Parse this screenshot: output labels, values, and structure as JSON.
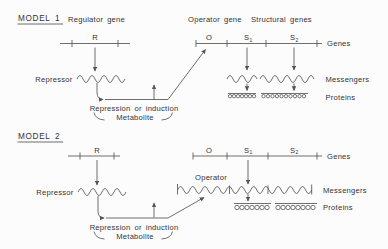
{
  "colors": {
    "ink": "#333333",
    "line": "#555555",
    "background": "#fcfcfc"
  },
  "model1": {
    "title": "MODEL 1",
    "regulator_gene": "Regulator gene",
    "operator_gene": "Operator gene",
    "structural_genes": "Structural genes",
    "r": "R",
    "o": "O",
    "s1": {
      "base": "S",
      "sub": "1"
    },
    "s2": {
      "base": "S",
      "sub": "2"
    },
    "genes": "Genes",
    "messengers": "Messengers",
    "proteins": "Proteins",
    "repressor": "Repressor",
    "repression": "Repression or induction",
    "metabolite": "Metabolite"
  },
  "model2": {
    "title": "MODEL 2",
    "r": "R",
    "o": "O",
    "s1": {
      "base": "S",
      "sub": "1"
    },
    "s2": {
      "base": "S",
      "sub": "2"
    },
    "genes": "Genes",
    "operator": "Operator",
    "messengers": "Messengers",
    "proteins": "Proteins",
    "repressor": "Repressor",
    "repression": "Repression or induction",
    "metabolite": "Metabolite"
  }
}
